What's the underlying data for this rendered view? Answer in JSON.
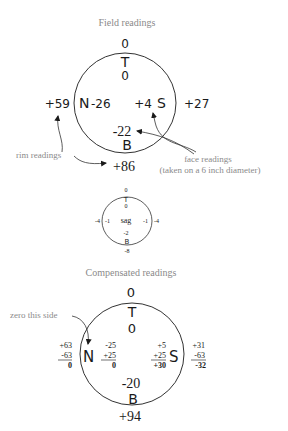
{
  "field": {
    "title": "Field readings",
    "top_outer": "0",
    "top_letter": "T",
    "top_inner": "0",
    "left_outer": "+59",
    "left_letter": "N",
    "left_inner": "-26",
    "right_inner": "+4",
    "right_letter": "S",
    "right_outer": "+27",
    "bottom_inner": "-22",
    "bottom_letter": "B",
    "bottom_outer": "+86",
    "rim_label": "rim readings",
    "face_label_1": "face readings",
    "face_label_2": "(taken on a 6 inch diameter)"
  },
  "sag": {
    "top_outer": "0",
    "top_letter": "T",
    "top_inner": "0",
    "left_outer": "-4",
    "left_inner": "-1",
    "center": "sag",
    "right_inner": "-1",
    "right_outer": "-4",
    "bottom_inner": "-2",
    "bottom_letter": "B",
    "bottom_outer": "-8"
  },
  "compensated": {
    "title": "Compensated readings",
    "zero_label": "zero this side",
    "top_outer": "0",
    "top_letter": "T",
    "top_inner": "0",
    "left_letter": "N",
    "right_letter": "S",
    "bottom_inner": "-20",
    "bottom_letter": "B",
    "bottom_outer": "+94",
    "left_rim": [
      "+63",
      "-63",
      "0"
    ],
    "left_face": [
      "-25",
      "+25",
      "0"
    ],
    "right_face": [
      "+5",
      "+25",
      "+30"
    ],
    "right_rim": [
      "+31",
      "-63",
      "-32"
    ]
  }
}
